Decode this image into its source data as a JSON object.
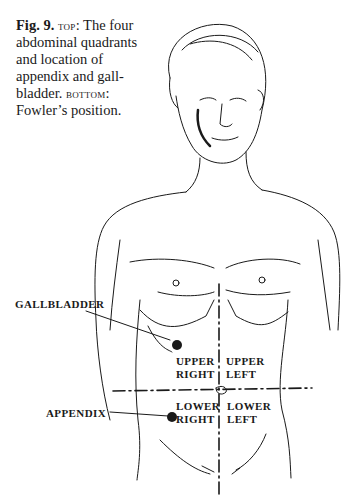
{
  "caption": {
    "figure_number": "Fig. 9.",
    "top_label": "top",
    "top_text": ": The four abdominal quadrants and location of appendix and gall-bladder. ",
    "bottom_label": "bottom",
    "bottom_text": ": Fowler’s position."
  },
  "labels": {
    "gallbladder": "GALLBLADDER",
    "appendix": "APPENDIX",
    "upper_right_1": "UPPER",
    "upper_right_2": "RIGHT",
    "upper_left_1": "UPPER",
    "upper_left_2": "LEFT",
    "lower_right_1": "LOWER",
    "lower_right_2": "RIGHT",
    "lower_left_1": "LOWER",
    "lower_left_2": "LEFT"
  },
  "colors": {
    "ink": "#1a1a1a",
    "paper": "#ffffff"
  }
}
